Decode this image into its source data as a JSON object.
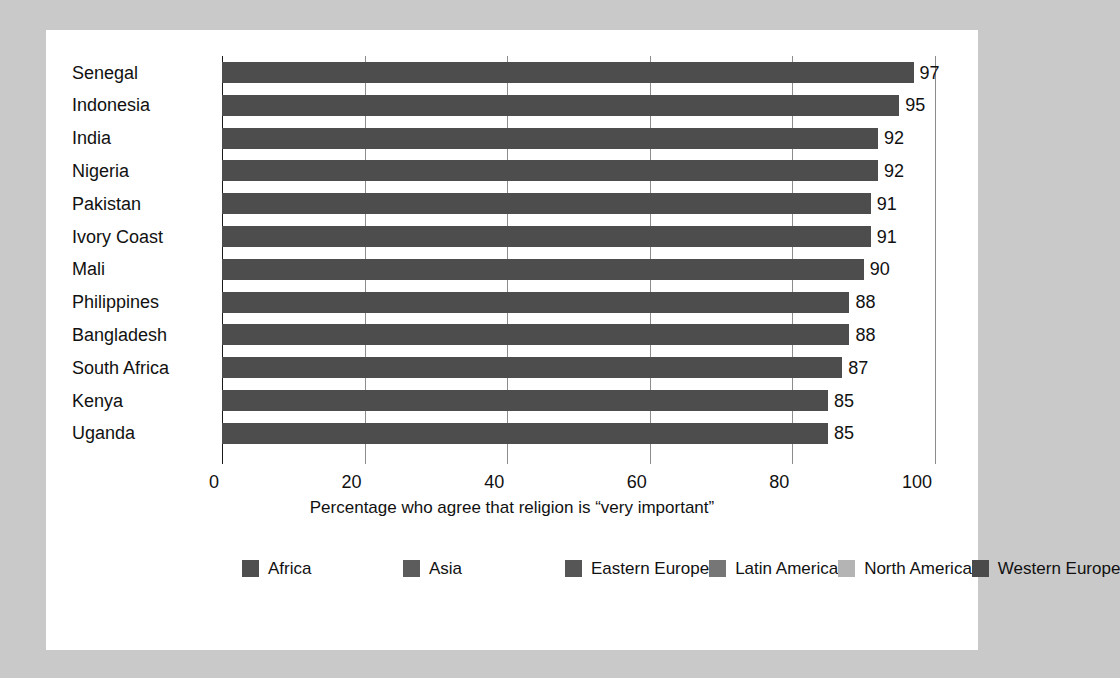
{
  "chart_data": {
    "type": "bar",
    "orientation": "horizontal",
    "title": "",
    "xlabel": "Percentage who agree that religion is “very important”",
    "ylabel": "",
    "xlim": [
      0,
      100
    ],
    "xticks": [
      0,
      20,
      40,
      60,
      80,
      100
    ],
    "xtick_labels": [
      "0",
      "20",
      "40",
      "60",
      "80",
      "100"
    ],
    "grid": "vertical",
    "legend_position": "bottom",
    "bar_color": "#4d4d4d",
    "categories": [
      "Senegal",
      "Indonesia",
      "India",
      "Nigeria",
      "Pakistan",
      "Ivory Coast",
      "Mali",
      "Philippines",
      "Bangladesh",
      "South Africa",
      "Kenya",
      "Uganda"
    ],
    "values": [
      97,
      95,
      92,
      92,
      91,
      91,
      90,
      88,
      88,
      87,
      85,
      85
    ],
    "value_labels": [
      "97",
      "95",
      "92",
      "92",
      "91",
      "91",
      "90",
      "88",
      "88",
      "87",
      "85",
      "85"
    ],
    "legend": [
      {
        "label": "Africa",
        "color": "#4f4f4f"
      },
      {
        "label": "Asia",
        "color": "#5c5c5c"
      },
      {
        "label": "Eastern Europe",
        "color": "#565656"
      },
      {
        "label": "Latin America",
        "color": "#767676"
      },
      {
        "label": "North America",
        "color": "#b4b4b4"
      },
      {
        "label": "Western Europe",
        "color": "#4a4a4a"
      }
    ]
  }
}
